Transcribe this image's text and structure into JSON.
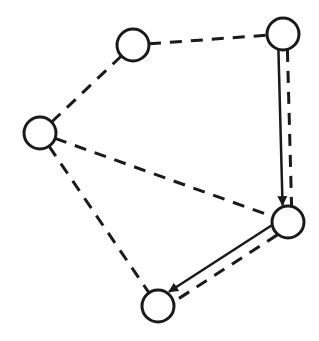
{
  "diagram": {
    "type": "graph",
    "width": 319,
    "height": 341,
    "stroke_color": "#1a1a1a",
    "background": "#ffffff",
    "node_radius": 16,
    "nodes": [
      {
        "id": "A",
        "x": 133,
        "y": 45
      },
      {
        "id": "B",
        "x": 283,
        "y": 34
      },
      {
        "id": "C",
        "x": 40,
        "y": 133
      },
      {
        "id": "D",
        "x": 288,
        "y": 222
      },
      {
        "id": "E",
        "x": 158,
        "y": 306
      }
    ],
    "dashed_edges": [
      {
        "from": "A",
        "to": "B"
      },
      {
        "from": "A",
        "to": "C"
      },
      {
        "from": "C",
        "to": "D"
      },
      {
        "from": "C",
        "to": "E"
      },
      {
        "from": "B",
        "to": "D",
        "offset": -4
      },
      {
        "from": "D",
        "to": "E",
        "offset": -5
      }
    ],
    "directed_edges": [
      {
        "from": "B",
        "to": "D",
        "offset": 5,
        "style": "solid-arrow"
      },
      {
        "from": "D",
        "to": "E",
        "offset": 6,
        "style": "solid-arrow"
      }
    ]
  }
}
